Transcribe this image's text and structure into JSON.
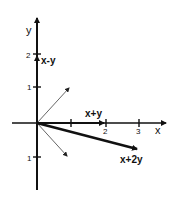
{
  "diagram": {
    "type": "vector-plot",
    "axes": {
      "x_label": "x",
      "y_label": "y",
      "x_ticks": [
        "1",
        "2",
        "3"
      ],
      "y_ticks_positive": [
        "1",
        "2"
      ],
      "y_ticks_negative": [
        "1"
      ]
    },
    "vectors": [
      {
        "name": "x-y",
        "label": "x-y",
        "weight": "thick"
      },
      {
        "name": "x+y",
        "label": "x+y",
        "weight": "thick"
      },
      {
        "name": "x+2y",
        "label": "x+2y",
        "weight": "thick"
      },
      {
        "name": "unit-up-right",
        "label": "",
        "weight": "thin"
      },
      {
        "name": "unit-down-right",
        "label": "",
        "weight": "thin"
      }
    ],
    "colors": {
      "ink": "#111111",
      "thin_ink": "#555555",
      "background": "#ffffff"
    }
  }
}
